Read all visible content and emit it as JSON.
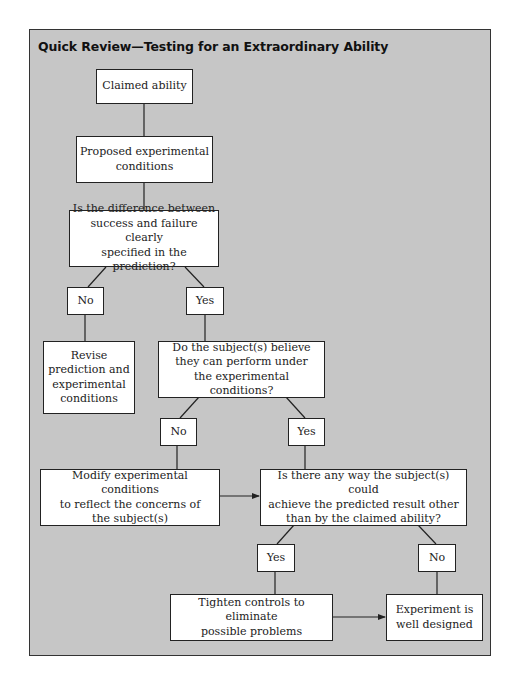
{
  "title": "Quick Review—Testing for an Extraordinary Ability",
  "colors": {
    "panel_background": "#c6c6c6",
    "box_fill": "#ffffff",
    "line": "#222222"
  },
  "nodes": {
    "claimed": "Claimed ability",
    "proposed": "Proposed experimental\nconditions",
    "q1": "Is the difference between\nsuccess and failure clearly\nspecified in the prediction?",
    "q1_no": "No",
    "q1_yes": "Yes",
    "revise": "Revise\nprediction and\nexperimental\nconditions",
    "q2": "Do the subject(s) believe\nthey can perform under\nthe experimental conditions?",
    "q2_no": "No",
    "q2_yes": "Yes",
    "modify": "Modify experimental conditions\nto reflect the concerns of\nthe subject(s)",
    "q3": "Is there any way the subject(s) could\nachieve the predicted result other\nthan by the claimed ability?",
    "q3_yes": "Yes",
    "q3_no": "No",
    "tighten": "Tighten controls to eliminate\npossible problems",
    "experiment": "Experiment is\nwell designed"
  },
  "edges": [
    {
      "from": "claimed",
      "to": "proposed"
    },
    {
      "from": "proposed",
      "to": "q1"
    },
    {
      "from": "q1",
      "to": "q1_no"
    },
    {
      "from": "q1",
      "to": "q1_yes"
    },
    {
      "from": "q1_no",
      "to": "revise"
    },
    {
      "from": "q1_yes",
      "to": "q2"
    },
    {
      "from": "q2",
      "to": "q2_no"
    },
    {
      "from": "q2",
      "to": "q2_yes"
    },
    {
      "from": "q2_no",
      "to": "modify"
    },
    {
      "from": "q2_yes",
      "to": "q3"
    },
    {
      "from": "modify",
      "to": "q3",
      "arrow": true
    },
    {
      "from": "q3",
      "to": "q3_yes"
    },
    {
      "from": "q3",
      "to": "q3_no"
    },
    {
      "from": "q3_yes",
      "to": "tighten"
    },
    {
      "from": "q3_no",
      "to": "experiment"
    },
    {
      "from": "tighten",
      "to": "experiment",
      "arrow": true
    }
  ]
}
